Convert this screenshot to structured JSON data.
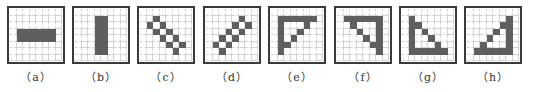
{
  "figure": {
    "grid_size": 8,
    "fill_color": "#5f5f5f",
    "panels": [
      {
        "label": "（a）",
        "name": "horizontal-line",
        "x": 7,
        "cells": [
          [
            3,
            1
          ],
          [
            3,
            2
          ],
          [
            3,
            3
          ],
          [
            3,
            4
          ],
          [
            3,
            5
          ],
          [
            3,
            6
          ],
          [
            4,
            1
          ],
          [
            4,
            2
          ],
          [
            4,
            3
          ],
          [
            4,
            4
          ],
          [
            4,
            5
          ],
          [
            4,
            6
          ]
        ]
      },
      {
        "label": "（b）",
        "name": "vertical-line",
        "x": 72,
        "cells": [
          [
            1,
            3
          ],
          [
            2,
            3
          ],
          [
            3,
            3
          ],
          [
            4,
            3
          ],
          [
            5,
            3
          ],
          [
            6,
            3
          ],
          [
            1,
            4
          ],
          [
            2,
            4
          ],
          [
            3,
            4
          ],
          [
            4,
            4
          ],
          [
            5,
            4
          ],
          [
            6,
            4
          ]
        ]
      },
      {
        "label": "（c）",
        "name": "diagonal-down-line",
        "x": 137,
        "cells": [
          [
            1,
            2
          ],
          [
            2,
            1
          ],
          [
            2,
            3
          ],
          [
            3,
            2
          ],
          [
            3,
            4
          ],
          [
            4,
            3
          ],
          [
            4,
            5
          ],
          [
            5,
            4
          ],
          [
            5,
            6
          ],
          [
            6,
            5
          ]
        ]
      },
      {
        "label": "（d）",
        "name": "diagonal-up-line",
        "x": 203,
        "cells": [
          [
            1,
            5
          ],
          [
            2,
            4
          ],
          [
            2,
            6
          ],
          [
            3,
            3
          ],
          [
            3,
            5
          ],
          [
            4,
            2
          ],
          [
            4,
            4
          ],
          [
            5,
            1
          ],
          [
            5,
            3
          ],
          [
            6,
            2
          ]
        ]
      },
      {
        "label": "（e）",
        "name": "top-left-corner",
        "x": 268,
        "cells": [
          [
            1,
            1
          ],
          [
            1,
            2
          ],
          [
            1,
            3
          ],
          [
            1,
            4
          ],
          [
            1,
            5
          ],
          [
            1,
            6
          ],
          [
            2,
            1
          ],
          [
            3,
            1
          ],
          [
            4,
            1
          ],
          [
            5,
            1
          ],
          [
            6,
            1
          ],
          [
            2,
            5
          ],
          [
            3,
            4
          ],
          [
            4,
            3
          ],
          [
            5,
            2
          ]
        ]
      },
      {
        "label": "（f）",
        "name": "top-right-corner",
        "x": 334,
        "cells": [
          [
            1,
            1
          ],
          [
            1,
            2
          ],
          [
            1,
            3
          ],
          [
            1,
            4
          ],
          [
            1,
            5
          ],
          [
            1,
            6
          ],
          [
            2,
            6
          ],
          [
            3,
            6
          ],
          [
            4,
            6
          ],
          [
            5,
            6
          ],
          [
            6,
            6
          ],
          [
            2,
            2
          ],
          [
            3,
            3
          ],
          [
            4,
            4
          ],
          [
            5,
            5
          ]
        ]
      },
      {
        "label": "（g）",
        "name": "bottom-left-corner",
        "x": 399,
        "cells": [
          [
            1,
            1
          ],
          [
            2,
            1
          ],
          [
            3,
            1
          ],
          [
            4,
            1
          ],
          [
            5,
            1
          ],
          [
            6,
            1
          ],
          [
            6,
            2
          ],
          [
            6,
            3
          ],
          [
            6,
            4
          ],
          [
            6,
            5
          ],
          [
            6,
            6
          ],
          [
            2,
            2
          ],
          [
            3,
            3
          ],
          [
            4,
            4
          ],
          [
            5,
            5
          ]
        ]
      },
      {
        "label": "（h）",
        "name": "bottom-right-corner",
        "x": 464,
        "cells": [
          [
            1,
            6
          ],
          [
            2,
            6
          ],
          [
            3,
            6
          ],
          [
            4,
            6
          ],
          [
            5,
            6
          ],
          [
            6,
            6
          ],
          [
            6,
            1
          ],
          [
            6,
            2
          ],
          [
            6,
            3
          ],
          [
            6,
            4
          ],
          [
            6,
            5
          ],
          [
            2,
            5
          ],
          [
            3,
            4
          ],
          [
            4,
            3
          ],
          [
            5,
            2
          ]
        ]
      }
    ]
  }
}
